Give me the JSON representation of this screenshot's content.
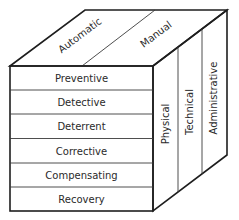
{
  "diagram": {
    "type": "3d-cube-matrix",
    "top_face": {
      "labels": [
        "Automatic",
        "Manual"
      ]
    },
    "front_face": {
      "rows": [
        "Preventive",
        "Detective",
        "Deterrent",
        "Corrective",
        "Compensating",
        "Recovery"
      ]
    },
    "side_face": {
      "columns": [
        "Physical",
        "Technical",
        "Administrative"
      ]
    },
    "colors": {
      "line": "#1e1e1e",
      "text": "#2a2a2a",
      "background": "#ffffff"
    }
  }
}
